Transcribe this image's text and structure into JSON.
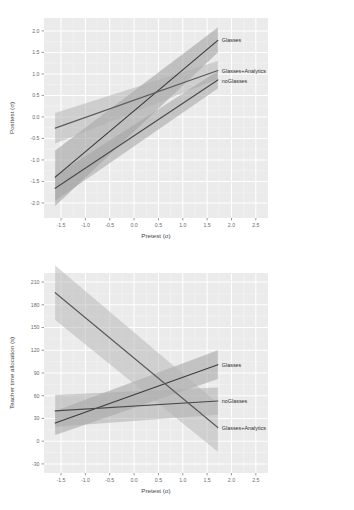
{
  "figure": {
    "background": "#ffffff",
    "panel_bg": "#ebebeb",
    "grid_major": "#ffffff",
    "grid_minor": "#f5f5f5",
    "tick_color": "#6b6b6b"
  },
  "chart_data": [
    {
      "id": "posttest",
      "type": "line",
      "title": "",
      "xlabel": "Pretest (σ)",
      "ylabel": "Posttest (σ)",
      "xlim": [
        -1.85,
        2.75
      ],
      "ylim": [
        -2.35,
        2.3
      ],
      "xticks": [
        -1.5,
        -1.0,
        -0.5,
        0.0,
        0.5,
        1.0,
        1.5,
        2.0,
        2.5
      ],
      "xtick_labels": [
        "-1.5",
        "-1.0",
        "-0.5",
        "0.0",
        "0.5",
        "1.0",
        "1.5",
        "2.0",
        "2.5"
      ],
      "yticks": [
        2.0,
        1.5,
        1.0,
        0.5,
        0.0,
        -0.5,
        -1.0,
        -1.5,
        -2.0
      ],
      "ytick_labels": [
        "2.0",
        "1.5",
        "1.0",
        "0.5",
        "0.0",
        "-0.5",
        "-1.0",
        "-1.5",
        "-2.0"
      ],
      "grid": true,
      "legend_position": "right-inline",
      "x_domain": [
        -1.62,
        1.72
      ],
      "series": [
        {
          "name": "Glasses",
          "color": "#3c3c3c",
          "ribbon_color": "#9a9a9a",
          "ribbon_opacity": 0.55,
          "fit": [
            -1.4,
            1.78
          ],
          "ci_lower": [
            -2.07,
            1.5
          ],
          "ci_upper": [
            -0.78,
            2.08
          ],
          "label_y": 1.78
        },
        {
          "name": "Glasses+Analytics",
          "color": "#5a5a5a",
          "ribbon_color": "#b0b0b0",
          "ribbon_opacity": 0.5,
          "fit": [
            -0.26,
            1.08
          ],
          "ci_lower": [
            -0.62,
            0.88
          ],
          "ci_upper": [
            0.09,
            1.3
          ],
          "label_y": 1.06
        },
        {
          "name": "noGlasses",
          "color": "#4a4a4a",
          "ribbon_color": "#a3a3a3",
          "ribbon_opacity": 0.55,
          "fit": [
            -1.66,
            0.86
          ],
          "ci_lower": [
            -1.95,
            0.66
          ],
          "ci_upper": [
            -1.36,
            1.07
          ],
          "label_y": 0.84
        }
      ]
    },
    {
      "id": "teacher-time",
      "type": "line",
      "title": "",
      "xlabel": "Pretest (σ)",
      "ylabel": "Teacher time allocation (s)",
      "xlim": [
        -1.85,
        2.75
      ],
      "ylim": [
        -42,
        222
      ],
      "xticks": [
        -1.5,
        -1.0,
        -0.5,
        0.0,
        0.5,
        1.0,
        1.5,
        2.0,
        2.5
      ],
      "xtick_labels": [
        "-1.5",
        "-1.0",
        "-0.5",
        "0.0",
        "0.5",
        "1.0",
        "1.5",
        "2.0",
        "2.5"
      ],
      "yticks": [
        210,
        180,
        150,
        120,
        90,
        60,
        30,
        0,
        -30
      ],
      "ytick_labels": [
        "210",
        "180",
        "150",
        "120",
        "90",
        "60",
        "30",
        "0",
        "-30"
      ],
      "grid": true,
      "legend_position": "right-inline",
      "x_domain": [
        -1.62,
        1.72
      ],
      "series": [
        {
          "name": "Glasses",
          "color": "#3c3c3c",
          "ribbon_color": "#9a9a9a",
          "ribbon_opacity": 0.5,
          "fit": [
            24,
            101
          ],
          "ci_lower": [
            8,
            82
          ],
          "ci_upper": [
            40,
            120
          ],
          "label_y": 101
        },
        {
          "name": "noGlasses",
          "color": "#4a4a4a",
          "ribbon_color": "#a8a8a8",
          "ribbon_opacity": 0.5,
          "fit": [
            40,
            53
          ],
          "ci_lower": [
            19,
            35
          ],
          "ci_upper": [
            61,
            71
          ],
          "label_y": 53
        },
        {
          "name": "Glasses+Analytics",
          "color": "#5a5a5a",
          "ribbon_color": "#b4b4b4",
          "ribbon_opacity": 0.5,
          "fit": [
            196,
            18
          ],
          "ci_lower": [
            160,
            -14
          ],
          "ci_upper": [
            232,
            50
          ],
          "label_y": 18
        }
      ]
    }
  ]
}
